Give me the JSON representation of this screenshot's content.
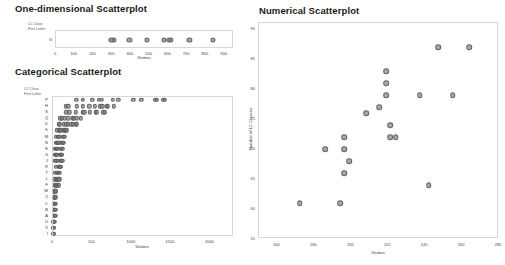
{
  "panels": {
    "one_dim": {
      "title": "One-dimensional Scatterplot",
      "corner_label_line1": "LC Class",
      "corner_label_line2": "First Letter",
      "row_label": "G"
    },
    "categorical": {
      "title": "Categorical Scatterplot",
      "corner_label_line1": "LC Class",
      "corner_label_line2": "First Letter"
    },
    "numerical": {
      "title": "Numerical Scatterplot"
    }
  },
  "chart_data": [
    {
      "id": "one-dimensional-scatterplot",
      "type": "scatter",
      "title": "One-dimensional Scatterplot",
      "xlabel": "Visitors",
      "ylabel": "LC Class First Letter",
      "xlim": [
        0,
        950
      ],
      "xticks": [
        0,
        100,
        200,
        300,
        400,
        500,
        600,
        700,
        800,
        900
      ],
      "categories": [
        "G"
      ],
      "grid": false,
      "legend": "none",
      "points": [
        {
          "x": 296,
          "y": "G"
        },
        {
          "x": 310,
          "y": "G"
        },
        {
          "x": 392,
          "y": "G"
        },
        {
          "x": 486,
          "y": "G"
        },
        {
          "x": 578,
          "y": "G"
        },
        {
          "x": 604,
          "y": "G"
        },
        {
          "x": 614,
          "y": "G"
        },
        {
          "x": 712,
          "y": "G"
        },
        {
          "x": 838,
          "y": "G"
        }
      ]
    },
    {
      "id": "categorical-scatterplot",
      "type": "scatter",
      "title": "Categorical Scatterplot",
      "xlabel": "Visitors",
      "ylabel": "LC Class First Letter",
      "xlim": [
        0,
        2300
      ],
      "xticks": [
        0,
        500,
        1000,
        1500,
        2000
      ],
      "categories": [
        "P",
        "H",
        "S",
        "Q",
        "D",
        "K",
        "M",
        "N",
        "E",
        "G",
        "J",
        "R",
        "T",
        "L",
        "F",
        "W",
        "Z",
        "C",
        "B",
        "A",
        "U",
        "V",
        "I"
      ],
      "grid": false,
      "legend": "none",
      "series": [
        {
          "name": "P",
          "values": [
            296,
            380,
            500,
            580,
            620,
            760,
            830,
            1020,
            1120,
            1300,
            1320,
            1400,
            1420
          ]
        },
        {
          "name": "H",
          "values": [
            160,
            195,
            300,
            380,
            460,
            530,
            600,
            628,
            680,
            700,
            770
          ]
        },
        {
          "name": "S",
          "values": [
            170,
            205,
            290,
            380,
            400,
            470,
            545,
            560,
            640,
            660
          ]
        },
        {
          "name": "Q",
          "values": [
            95,
            110,
            150,
            195,
            250,
            262,
            300,
            350
          ]
        },
        {
          "name": "D",
          "values": [
            70,
            85,
            140,
            170,
            185,
            235,
            250,
            290,
            300
          ]
        },
        {
          "name": "K",
          "values": [
            48,
            80,
            92,
            100,
            140,
            150,
            160,
            175
          ]
        },
        {
          "name": "M",
          "values": [
            35,
            60,
            72,
            82,
            125,
            135,
            145
          ]
        },
        {
          "name": "N",
          "values": [
            40,
            55,
            66,
            78,
            112,
            122,
            132
          ]
        },
        {
          "name": "E",
          "values": [
            22,
            38,
            50,
            62,
            100,
            110,
            120
          ]
        },
        {
          "name": "G",
          "values": [
            30,
            42,
            52,
            95,
            105,
            115
          ]
        },
        {
          "name": "J",
          "values": [
            28,
            40,
            62,
            96,
            108,
            118
          ]
        },
        {
          "name": "R",
          "values": [
            38,
            70,
            82,
            92,
            100
          ]
        },
        {
          "name": "T",
          "values": [
            25,
            45,
            58,
            72,
            86
          ]
        },
        {
          "name": "L",
          "values": [
            18,
            32,
            45,
            58,
            70,
            80
          ]
        },
        {
          "name": "F",
          "values": [
            20,
            34,
            46,
            62,
            74
          ]
        },
        {
          "name": "W",
          "values": [
            12,
            20,
            28,
            36
          ]
        },
        {
          "name": "Z",
          "values": [
            10,
            18,
            26,
            34
          ]
        },
        {
          "name": "C",
          "values": [
            10,
            17,
            24,
            32
          ]
        },
        {
          "name": "B",
          "values": [
            8,
            15,
            22,
            30
          ]
        },
        {
          "name": "A",
          "values": [
            8,
            14,
            20,
            27
          ]
        },
        {
          "name": "U",
          "values": [
            6,
            12,
            18
          ]
        },
        {
          "name": "V",
          "values": [
            5,
            10
          ]
        },
        {
          "name": "I",
          "values": [
            4,
            9
          ]
        }
      ]
    },
    {
      "id": "numerical-scatterplot",
      "type": "scatter",
      "title": "Numerical Scatterplot",
      "xlabel": "Visitors",
      "ylabel": "Number of LC Classes",
      "xlim": [
        150,
        280
      ],
      "ylim": [
        55,
        91
      ],
      "xticks": [
        160,
        180,
        200,
        220,
        240,
        260,
        280
      ],
      "yticks": [
        55,
        60,
        65,
        70,
        75,
        80,
        85,
        90
      ],
      "grid": false,
      "legend": "none",
      "points": [
        {
          "x": 172,
          "y": 61
        },
        {
          "x": 186,
          "y": 70
        },
        {
          "x": 194,
          "y": 61
        },
        {
          "x": 196,
          "y": 72
        },
        {
          "x": 196,
          "y": 70
        },
        {
          "x": 196,
          "y": 66
        },
        {
          "x": 199,
          "y": 68
        },
        {
          "x": 208,
          "y": 76
        },
        {
          "x": 215,
          "y": 77
        },
        {
          "x": 219,
          "y": 83
        },
        {
          "x": 219,
          "y": 81
        },
        {
          "x": 219,
          "y": 79
        },
        {
          "x": 221,
          "y": 74
        },
        {
          "x": 221,
          "y": 72
        },
        {
          "x": 224,
          "y": 72
        },
        {
          "x": 237,
          "y": 79
        },
        {
          "x": 242,
          "y": 64
        },
        {
          "x": 247,
          "y": 87
        },
        {
          "x": 255,
          "y": 79
        },
        {
          "x": 264,
          "y": 87
        }
      ]
    }
  ],
  "colors": {
    "dot_fill": "#808080",
    "dot_stroke": "#5a5a5a",
    "frame": "#d8d8d8",
    "text": "#333333",
    "title": "#1a1a1a"
  }
}
